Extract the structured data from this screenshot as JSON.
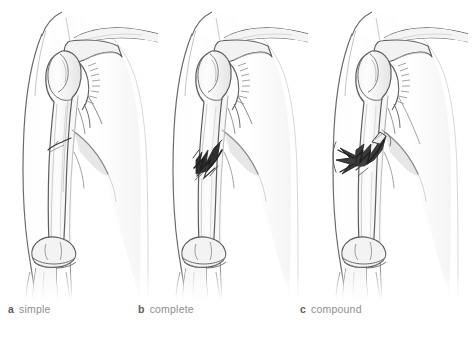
{
  "figure": {
    "background_color": "#ffffff",
    "line_color": "#555555",
    "fracture_dark_color": "#2b2b2b",
    "caption_color": "#8e8e8e"
  },
  "panels": [
    {
      "letter": "a",
      "label": "simple",
      "fracture_type": "simple",
      "description": "Thin oblique crack line across the mid-shaft of the humerus with no displacement",
      "region": "right shoulder and upper arm, anterior view"
    },
    {
      "letter": "b",
      "label": "complete",
      "fracture_type": "complete",
      "description": "Dark jagged complete break through the humeral shaft with displaced sharp bone ends contained within the skin",
      "region": "right shoulder and upper arm, anterior view"
    },
    {
      "letter": "c",
      "label": "compound",
      "fracture_type": "compound",
      "description": "Complete break of the humeral shaft with a bone fragment spike piercing outward through the skin",
      "region": "right shoulder and upper arm, anterior view"
    }
  ],
  "anatomy": {
    "structures": [
      "clavicle",
      "acromion",
      "scapula",
      "glenoid",
      "joint capsule",
      "humeral head",
      "greater tubercle",
      "humeral shaft",
      "medial epicondyle",
      "lateral epicondyle",
      "trochlea",
      "radius",
      "ulna",
      "torso outline",
      "arm skin contour"
    ]
  }
}
